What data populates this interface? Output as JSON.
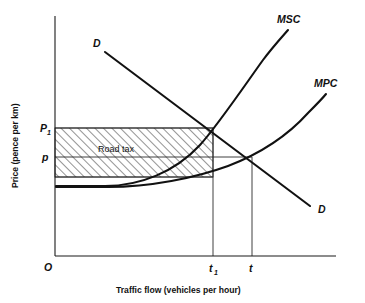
{
  "figure": {
    "type": "economics-diagram",
    "title_visible": false
  },
  "axes": {
    "y_title": "Price (pence per km)",
    "x_title": "Traffic flow (vehicles per hour)",
    "origin_label": "O",
    "y_ticks": [
      {
        "label": "P",
        "subscript": "1",
        "value_y": 128
      },
      {
        "label": "p",
        "subscript": "",
        "value_y": 157
      }
    ],
    "x_ticks": [
      {
        "label": "t",
        "subscript": "1",
        "value_x": 213
      },
      {
        "label": "t",
        "subscript": "",
        "value_x": 252
      }
    ]
  },
  "curves": [
    {
      "name": "demand-upper",
      "label": "D"
    },
    {
      "name": "demand-lower",
      "label": "D"
    },
    {
      "name": "marginal-social-cost",
      "label": "MSC"
    },
    {
      "name": "marginal-private-cost",
      "label": "MPC"
    }
  ],
  "regions": [
    {
      "name": "road-tax-area",
      "label": "Road tax",
      "fill": "hatched"
    }
  ],
  "colors": {
    "curve": "#111111",
    "axis": "#1a1a1a",
    "hatch": "#3a3a3a",
    "background": "#ffffff"
  }
}
